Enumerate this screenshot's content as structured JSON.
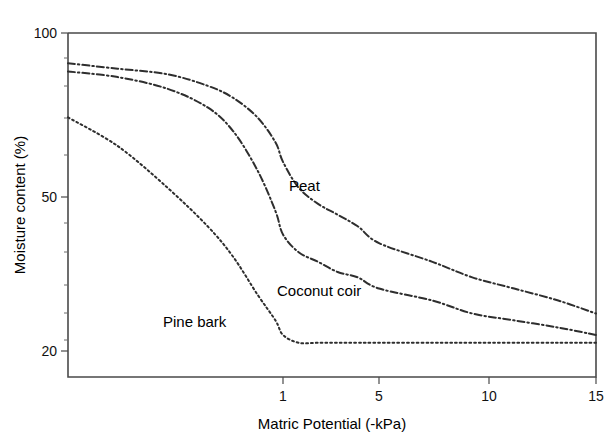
{
  "chart_data": {
    "type": "line",
    "title": "",
    "subtitle": "",
    "xlabel": "Matric Potential (-kPa)",
    "ylabel": "Moisture content (%)",
    "x_scale": "log-like",
    "y_scale": "log",
    "xlim": [
      0.05,
      15
    ],
    "ylim": [
      18,
      100
    ],
    "grid": false,
    "legend_position": "inline-annotations",
    "x_ticks": [
      {
        "label": "1",
        "value": 1
      },
      {
        "label": "5",
        "value": 5
      },
      {
        "label": "10",
        "value": 10
      },
      {
        "label": "15",
        "value": 15
      }
    ],
    "y_ticks": [
      {
        "label": "100",
        "value": 100
      },
      {
        "label": "50",
        "value": 50
      },
      {
        "label": "20",
        "value": 20
      }
    ],
    "y_minor_ticks": [
      90,
      80,
      70,
      60,
      45,
      40,
      35,
      30,
      25
    ],
    "series": [
      {
        "name": "Peat",
        "line_style": "dash-dot",
        "color": "#2e2e2e",
        "label_annotation": "Peat",
        "x": [
          0.05,
          0.1,
          0.2,
          0.35,
          0.5,
          0.7,
          0.9,
          1.0,
          1.3,
          1.8,
          2.5,
          3.5,
          5.0,
          7.0,
          9.0,
          11.0,
          13.0,
          15.0
        ],
        "values": [
          88,
          86,
          84,
          80,
          76,
          70,
          63,
          58,
          52,
          48,
          45,
          42,
          38,
          34,
          31,
          29,
          27,
          25
        ]
      },
      {
        "name": "Coconut coir",
        "line_style": "dash-dot",
        "color": "#2e2e2e",
        "label_annotation": "Coconut coir",
        "x": [
          0.05,
          0.1,
          0.2,
          0.35,
          0.5,
          0.7,
          0.9,
          1.0,
          1.3,
          1.8,
          2.5,
          3.5,
          5.0,
          7.0,
          9.0,
          11.0,
          13.0,
          15.0
        ],
        "values": [
          85,
          83,
          79,
          73,
          66,
          56,
          46,
          40,
          36,
          34,
          32,
          31,
          29,
          27,
          25,
          24,
          23,
          22
        ]
      },
      {
        "name": "Pine bark",
        "line_style": "dotted",
        "color": "#2e2e2e",
        "label_annotation": "Pine bark",
        "x": [
          0.05,
          0.1,
          0.2,
          0.35,
          0.5,
          0.7,
          0.9,
          1.0,
          1.3,
          1.8,
          2.5,
          3.5,
          5.0,
          7.0,
          9.0,
          11.0,
          13.0,
          15.0
        ],
        "values": [
          70,
          62,
          52,
          42,
          35,
          28,
          24,
          22,
          21,
          21,
          21,
          21,
          21,
          21,
          21,
          21,
          21,
          21
        ]
      }
    ],
    "annotations": [
      {
        "text": "Peat",
        "x_px": 289,
        "y_px": 191
      },
      {
        "text": "Coconut coir",
        "x_px": 277,
        "y_px": 296
      },
      {
        "text": "Pine bark",
        "x_px": 163,
        "y_px": 327
      }
    ]
  }
}
